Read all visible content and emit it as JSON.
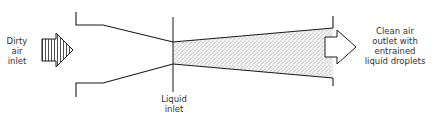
{
  "diagram": {
    "labels": {
      "dirty_air_inlet": "Dirty\nair\ninlet",
      "liquid_inlet": "Liquid\ninlet",
      "clean_air_outlet": "Clean air\noutlet with\nentrained\nliquid droplets"
    },
    "colors": {
      "line": "#1a1a1a",
      "text": "#333333",
      "stipple": "#555555",
      "background": "#ffffff"
    }
  }
}
